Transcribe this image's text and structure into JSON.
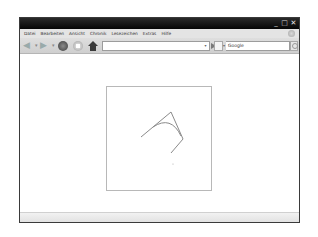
{
  "window": {
    "controls": {
      "minimize_icon": "minimize-icon",
      "maximize_icon": "maximize-icon",
      "close_icon": "close-icon"
    }
  },
  "menubar": {
    "items": [
      {
        "label": "Datei"
      },
      {
        "label": "Bearbeiten"
      },
      {
        "label": "Ansicht"
      },
      {
        "label": "Chronik"
      },
      {
        "label": "Lesezeichen"
      },
      {
        "label": "Extras"
      },
      {
        "label": "Hilfe"
      }
    ]
  },
  "toolbar": {
    "back_icon": "back-arrow-icon",
    "forward_icon": "forward-arrow-icon",
    "reload_icon": "reload-icon",
    "stop_icon": "stop-icon",
    "home_icon": "home-icon",
    "url_value": "",
    "go_icon": "go-arrow-icon",
    "search_engine_icon": "search-engine-icon",
    "search_placeholder": "Google",
    "search_button_icon": "magnifier-icon"
  },
  "canvas": {
    "description": "Canvas drawing with control-point lines and a curve",
    "stroke_color": "#8a8a8a",
    "polyline_points": [
      [
        34,
        50
      ],
      [
        64,
        25
      ],
      [
        76,
        52
      ],
      [
        64,
        66
      ]
    ],
    "curve": {
      "start": [
        46,
        40
      ],
      "control": [
        64,
        28
      ],
      "end": [
        74,
        49
      ]
    },
    "dot": [
      66,
      77
    ]
  },
  "statusbar": {
    "text": ""
  }
}
